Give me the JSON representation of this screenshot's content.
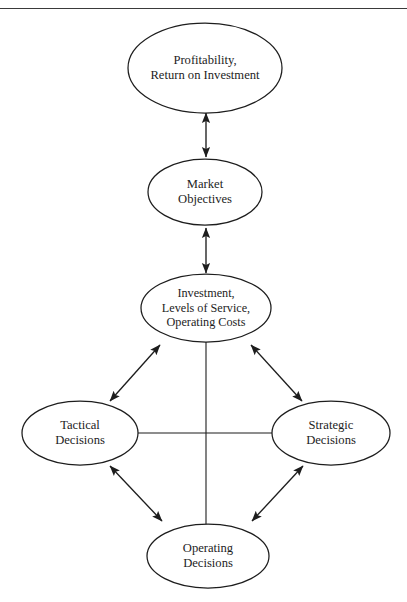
{
  "figure": {
    "type": "flow-diagram",
    "background_color": "#ffffff",
    "stroke_color": "#1d1d1d",
    "top_rule": true
  },
  "nodes": [
    {
      "id": "profitability",
      "name": "profitability-node",
      "shape": "ellipse",
      "cx": 205,
      "cy": 68,
      "rx": 77,
      "ry": 45,
      "lines": [
        "Profitability,",
        "Return on Investment"
      ]
    },
    {
      "id": "market_objectives",
      "name": "market-objectives-node",
      "shape": "ellipse",
      "cx": 205,
      "cy": 192,
      "rx": 57,
      "ry": 33,
      "lines": [
        "Market",
        "Objectives"
      ]
    },
    {
      "id": "investment",
      "name": "investment-node",
      "shape": "ellipse",
      "cx": 206,
      "cy": 308,
      "rx": 65,
      "ry": 34,
      "lines": [
        "Investment,",
        "Levels of Service,",
        "Operating Costs"
      ]
    },
    {
      "id": "tactical",
      "name": "tactical-decisions-node",
      "shape": "ellipse",
      "cx": 80,
      "cy": 433,
      "rx": 58,
      "ry": 32,
      "lines": [
        "Tactical",
        "Decisions"
      ]
    },
    {
      "id": "strategic",
      "name": "strategic-decisions-node",
      "shape": "ellipse",
      "cx": 331,
      "cy": 433,
      "rx": 59,
      "ry": 32,
      "lines": [
        "Strategic",
        "Decisions"
      ]
    },
    {
      "id": "operating",
      "name": "operating-decisions-node",
      "shape": "ellipse",
      "cx": 208,
      "cy": 556,
      "rx": 61,
      "ry": 32,
      "lines": [
        "Operating",
        "Decisions"
      ]
    }
  ],
  "connectors": [
    {
      "id": "c1",
      "name": "connector-profitability-market",
      "from": "profitability",
      "to": "market_objectives",
      "style": "double-arrow",
      "x1": 206,
      "y1": 113,
      "x2": 206,
      "y2": 157
    },
    {
      "id": "c2",
      "name": "connector-market-investment",
      "from": "market_objectives",
      "to": "investment",
      "style": "double-arrow",
      "x1": 206,
      "y1": 228,
      "x2": 206,
      "y2": 273
    },
    {
      "id": "c3",
      "name": "connector-tactical-investment",
      "from": "tactical",
      "to": "investment",
      "style": "double-arrow",
      "x1": 110,
      "y1": 401,
      "x2": 160,
      "y2": 345
    },
    {
      "id": "c4",
      "name": "connector-investment-strategic",
      "from": "investment",
      "to": "strategic",
      "style": "double-arrow",
      "x1": 251,
      "y1": 345,
      "x2": 302,
      "y2": 401
    },
    {
      "id": "c5",
      "name": "connector-tactical-operating",
      "from": "tactical",
      "to": "operating",
      "style": "double-arrow",
      "x1": 110,
      "y1": 466,
      "x2": 162,
      "y2": 521
    },
    {
      "id": "c6",
      "name": "connector-operating-strategic",
      "from": "operating",
      "to": "strategic",
      "style": "double-arrow",
      "x1": 252,
      "y1": 521,
      "x2": 303,
      "y2": 466
    },
    {
      "id": "c7",
      "name": "connector-tactical-strategic-line",
      "from": "tactical",
      "to": "strategic",
      "style": "plain-line",
      "x1": 138,
      "y1": 433,
      "x2": 272,
      "y2": 433
    },
    {
      "id": "c8",
      "name": "connector-investment-operating-line",
      "from": "investment",
      "to": "operating",
      "style": "plain-line",
      "x1": 206,
      "y1": 342,
      "x2": 206,
      "y2": 524
    }
  ]
}
